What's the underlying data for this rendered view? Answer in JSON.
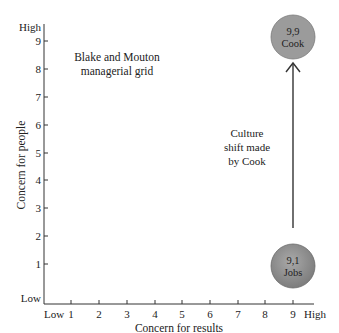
{
  "diagram": {
    "title_line1": "Blake and Mouton",
    "title_line2": "managerial grid",
    "y_axis": {
      "label": "Concern for people",
      "low_label": "Low",
      "high_label": "High",
      "ticks": [
        "1",
        "2",
        "3",
        "4",
        "5",
        "6",
        "7",
        "8",
        "9"
      ]
    },
    "x_axis": {
      "label": "Concern for results",
      "low_label": "Low",
      "high_label": "High",
      "ticks": [
        "1",
        "2",
        "3",
        "4",
        "5",
        "6",
        "7",
        "8",
        "9"
      ]
    },
    "points": [
      {
        "coord": "9,9",
        "name": "Cook"
      },
      {
        "coord": "9,1",
        "name": "Jobs"
      }
    ],
    "arrow_label": [
      "Culture",
      "shift made",
      "by Cook"
    ],
    "colors": {
      "circle_fill": "#9a9a9a",
      "circle_stroke": "#6e6e6e",
      "axis": "#333333",
      "text": "#222222"
    }
  }
}
